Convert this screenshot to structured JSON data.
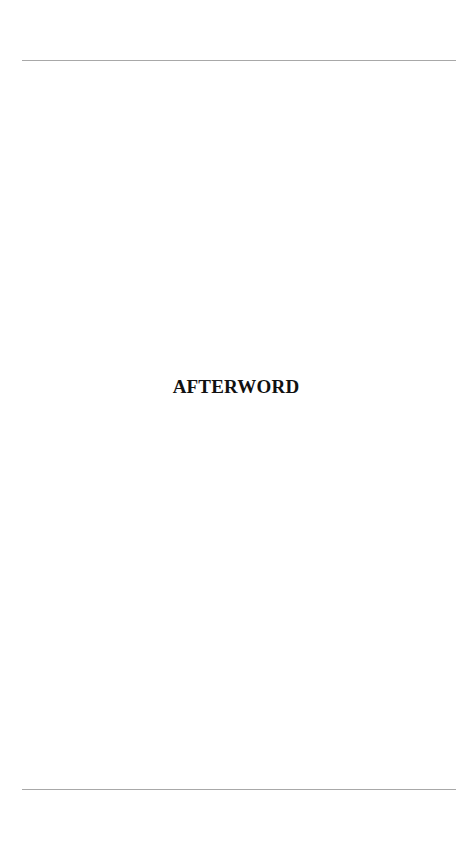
{
  "page": {
    "title": "AFTERWORD"
  }
}
